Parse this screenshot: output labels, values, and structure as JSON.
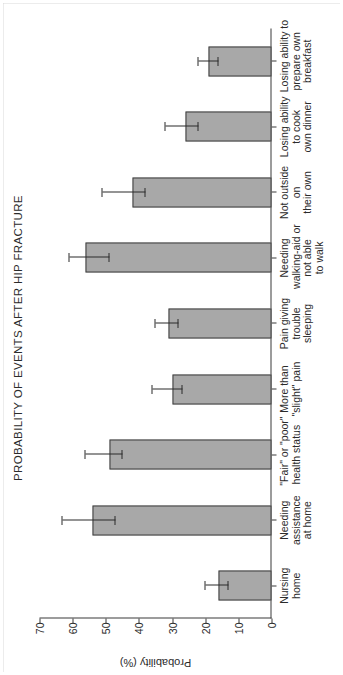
{
  "figure": {
    "title": "PROBABILITY OF EVENTS AFTER HIP FRACTURE",
    "value_axis_title": "Probability (%)",
    "orientation": "page-rotated-90-ccw",
    "bar_fill_color": "#a8a8a8",
    "bar_edge_color": "#3f3f3f",
    "axis_color": "#3a3a3a"
  },
  "axis_ticks": [
    "0",
    "10",
    "20",
    "30",
    "40",
    "50",
    "60",
    "70"
  ],
  "categories": [
    {
      "lines": [
        "Nursing",
        "home"
      ]
    },
    {
      "lines": [
        "Needing",
        "assistance",
        "at home"
      ]
    },
    {
      "lines": [
        "\"Fair\" or \"poor\"",
        "health status"
      ]
    },
    {
      "lines": [
        "More than",
        "\"slight\" pain"
      ]
    },
    {
      "lines": [
        "Pain giving",
        "trouble",
        "sleeping"
      ]
    },
    {
      "lines": [
        "Needing",
        "walking-aid or",
        "not able",
        "to walk"
      ]
    },
    {
      "lines": [
        "Not outside",
        "on",
        "their own"
      ]
    },
    {
      "lines": [
        "Losing ability",
        "to cook",
        "own dinner"
      ]
    },
    {
      "lines": [
        "Losing ability to",
        "prepare own",
        "breakfast"
      ]
    }
  ],
  "chart_data": {
    "type": "bar",
    "title": "PROBABILITY OF EVENTS AFTER HIP FRACTURE",
    "xlabel": "",
    "ylabel": "Probability (%)",
    "ylim": [
      0,
      70
    ],
    "yticks": [
      0,
      10,
      20,
      30,
      40,
      50,
      60,
      70
    ],
    "grid": false,
    "legend": "none",
    "orientation": "vertical-bars-on-rotated-page",
    "error_bars": "95% confidence interval",
    "categories": [
      "Nursing home",
      "Needing assistance at home",
      "\"Fair\" or \"poor\" health status",
      "More than \"slight\" pain",
      "Pain giving trouble sleeping",
      "Needing walking-aid or not able to walk",
      "Not outside on their own",
      "Losing ability to cook own dinner",
      "Losing ability to prepare own breakfast"
    ],
    "values": [
      16,
      54,
      49,
      30,
      31,
      56,
      42,
      26,
      19
    ],
    "err_low": [
      13,
      47,
      45,
      27,
      28,
      49,
      38,
      22,
      16
    ],
    "err_high": [
      20,
      63,
      56,
      36,
      35,
      61,
      51,
      32,
      22
    ]
  }
}
